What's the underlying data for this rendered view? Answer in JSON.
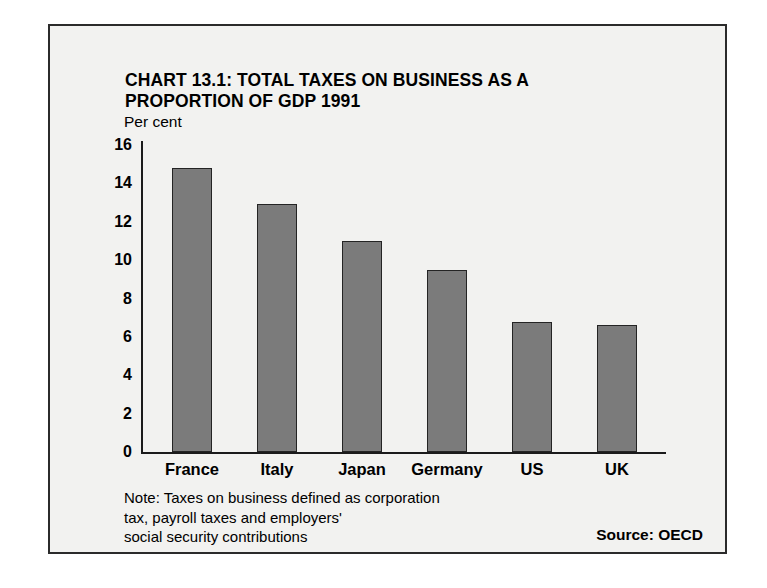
{
  "chart_data": {
    "type": "bar",
    "title": "CHART 13.1: TOTAL TAXES ON BUSINESS AS A PROPORTION OF GDP 1991",
    "title_line1": "CHART 13.1: TOTAL TAXES ON BUSINESS AS A",
    "title_line2": "PROPORTION OF GDP 1991",
    "categories": [
      "France",
      "Italy",
      "Japan",
      "Germany",
      "US",
      "UK"
    ],
    "values": [
      14.8,
      12.9,
      11.0,
      9.5,
      6.8,
      6.6
    ],
    "xlabel": "",
    "ylabel": "Per cent",
    "ylim": [
      0,
      16
    ],
    "ytick_labels": [
      "16",
      "14",
      "12",
      "10",
      "8",
      "6",
      "4",
      "2",
      "0"
    ],
    "ytick_values": [
      16,
      14,
      12,
      10,
      8,
      6,
      4,
      2,
      0
    ],
    "grid": false,
    "legend": "none",
    "bar_color": "#7b7b7b",
    "bar_edge_color": "#242424",
    "background_color": "#f2f2f0",
    "border_color": "#2b2b2b",
    "note_line1": "Note: Taxes on business defined as corporation",
    "note_line2": "tax, payroll taxes and employers'",
    "note_line3": "social security contributions",
    "source": "Source: OECD"
  }
}
